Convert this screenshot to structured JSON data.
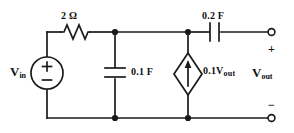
{
  "diagram": {
    "stroke_color": "#1a1a1a",
    "background_color": "#ffffff"
  },
  "components": {
    "resistor": {
      "name": "resistor-2-ohm",
      "label": "2 Ω",
      "value": 2,
      "unit": "Ω"
    },
    "capacitor_shunt": {
      "name": "capacitor-0.1-farad",
      "label": "0.1 F",
      "value": 0.1,
      "unit": "F"
    },
    "capacitor_series": {
      "name": "capacitor-0.2-farad",
      "label": "0.2 F",
      "value": 0.2,
      "unit": "F"
    },
    "dependent_source": {
      "name": "dependent-current-source",
      "label_prefix": "0.1",
      "label_var": "V",
      "label_sub": "out",
      "gain": 0.1,
      "controlled_by": "Vout"
    },
    "voltage_source": {
      "name": "independent-voltage-source",
      "label_var": "V",
      "label_sub": "in",
      "plus": "+",
      "minus": "−"
    },
    "output_port": {
      "name": "output-port",
      "label_var": "V",
      "label_sub": "out",
      "plus": "+",
      "minus": "−"
    }
  }
}
